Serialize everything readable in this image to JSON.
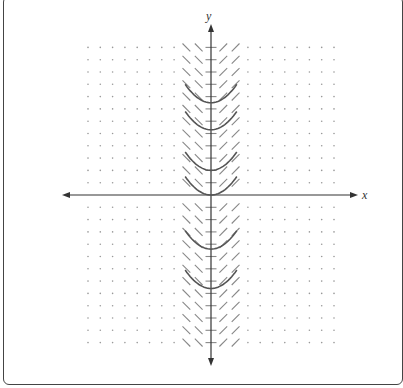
{
  "diagram": {
    "type": "slope-field",
    "axes": {
      "x_label": "x",
      "y_label": "y"
    },
    "grid": {
      "x_range": [
        -10,
        10
      ],
      "y_range": [
        -12,
        12
      ],
      "slope_columns": [
        -2,
        -1,
        0,
        1,
        2
      ],
      "slope_by_column": {
        "-2": -1,
        "-1": -1,
        "0": 0,
        "1": 1,
        "2": 1
      }
    },
    "solution_curves": {
      "min_y_values": [
        7.5,
        5.3,
        2,
        0,
        -4.4,
        -7.6
      ],
      "x_extent": [
        -2.1,
        2.1
      ]
    },
    "colors": {
      "axis": "#333333",
      "curve": "#555555",
      "slope": "#888888",
      "dot": "#999999"
    }
  }
}
